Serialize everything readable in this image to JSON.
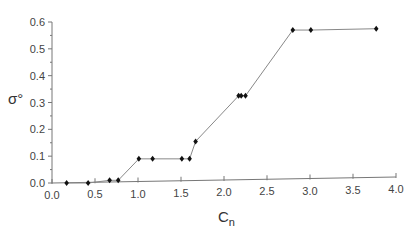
{
  "chart_data": {
    "type": "line",
    "title": "",
    "xlabel": "C_n",
    "xlabel_main": "C",
    "xlabel_sub": "n",
    "ylabel": "σ°",
    "xlim": [
      0.0,
      4.0
    ],
    "ylim": [
      0.0,
      0.6
    ],
    "xticks": [
      "0.0",
      "0.5",
      "1.0",
      "1.5",
      "2.0",
      "2.5",
      "3.0",
      "3.5",
      "4.0"
    ],
    "yticks": [
      "0.0",
      "0.1",
      "0.2",
      "0.3",
      "0.4",
      "0.5",
      "0.6"
    ],
    "grid": false,
    "legend": null,
    "marker": "diamond",
    "series": [
      {
        "name": "σ° vs C_n",
        "x": [
          0.17,
          0.42,
          0.67,
          0.77,
          1.01,
          1.17,
          1.51,
          1.6,
          1.67,
          2.17,
          2.2,
          2.25,
          2.8,
          3.01,
          3.77
        ],
        "y": [
          0.0,
          0.0,
          0.01,
          0.01,
          0.09,
          0.09,
          0.09,
          0.09,
          0.155,
          0.325,
          0.325,
          0.325,
          0.57,
          0.57,
          0.575
        ]
      }
    ]
  },
  "colors": {
    "line": "#888888",
    "marker": "#111111",
    "axis": "#777777"
  }
}
